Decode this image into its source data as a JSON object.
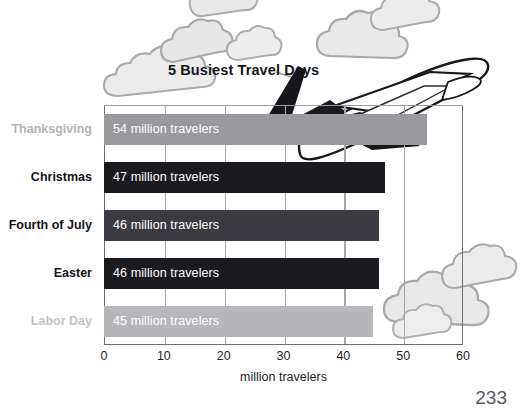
{
  "page": {
    "number": "233",
    "background_color": "#ffffff"
  },
  "chart_title": "5 Busiest Travel Days",
  "decorations": [
    {
      "name": "airplane-illustration",
      "description": "jet airliner taking off across the top of the chart"
    },
    {
      "name": "cloud-cluster-top-left",
      "description": "light gray cloud puffs behind the title"
    },
    {
      "name": "cloud-cluster-top-right",
      "description": "light gray cloud puffs at upper right"
    },
    {
      "name": "cloud-cluster-bottom-right",
      "description": "light gray cloud puffs at lower right"
    }
  ],
  "axis": {
    "x_title": "million travelers",
    "x_ticks": [
      "0",
      "10",
      "20",
      "30",
      "40",
      "50",
      "60"
    ]
  },
  "chart_data": {
    "type": "bar",
    "orientation": "horizontal",
    "title": "5 Busiest Travel Days",
    "xlabel": "million travelers",
    "ylabel": "",
    "xlim": [
      0,
      60
    ],
    "xticks": [
      0,
      10,
      20,
      30,
      40,
      50,
      60
    ],
    "grid": true,
    "grid_axis": "x",
    "legend": false,
    "unit": "million travelers",
    "categories": [
      "Thanksgiving",
      "Christmas",
      "Fourth of July",
      "Easter",
      "Labor Day"
    ],
    "values": [
      54,
      47,
      46,
      46,
      45
    ],
    "bars": [
      {
        "category": "Thanksgiving",
        "value": 54,
        "data_label": "54 million travelers",
        "bar_color": "#9a9a9e",
        "category_label_color": "#b3b3b8"
      },
      {
        "category": "Christmas",
        "value": 47,
        "data_label": "47 million travelers",
        "bar_color": "#1b1b1f",
        "category_label_color": "#141418"
      },
      {
        "category": "Fourth of July",
        "value": 46,
        "data_label": "46 million travelers",
        "bar_color": "#3b3b41",
        "category_label_color": "#141418"
      },
      {
        "category": "Easter",
        "value": 46,
        "data_label": "46 million travelers",
        "bar_color": "#1b1b1f",
        "category_label_color": "#141418"
      },
      {
        "category": "Labor Day",
        "value": 45,
        "data_label": "45 million travelers",
        "bar_color": "#b6b6bb",
        "category_label_color": "#c2c2c7"
      }
    ]
  },
  "colors": {
    "frame": "#6e6e74",
    "gridline": "#a7a7ad",
    "bar_text": "#ffffff",
    "axis_text": "#1d1d1d",
    "cloud_fill": "#e8e8e8",
    "cloud_stroke": "#a9a9ac"
  }
}
